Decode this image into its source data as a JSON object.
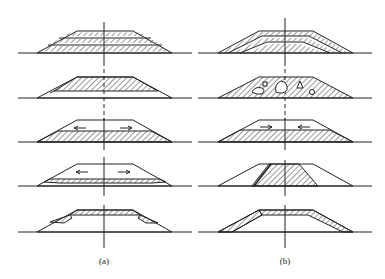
{
  "figure": {
    "colors": {
      "line": "#222222",
      "hatch": "#333333",
      "background": "#ffffff"
    },
    "columns": [
      {
        "label": "(a)",
        "center_x": 104,
        "rows": [
          {
            "id": "a1",
            "type": "horizontal-layers",
            "ground_y": 53
          },
          {
            "id": "a2",
            "type": "top-hatched-core",
            "ground_y": 98
          },
          {
            "id": "a3",
            "type": "bottom-fill-arrows-outward",
            "ground_y": 142
          },
          {
            "id": "a4",
            "type": "bottom-fill-arrows-outward-thin",
            "ground_y": 186
          },
          {
            "id": "a5",
            "type": "crest-and-berms-hatched",
            "ground_y": 232
          }
        ]
      },
      {
        "label": "(b)",
        "center_x": 285,
        "rows": [
          {
            "id": "b1",
            "type": "inclined-layers",
            "ground_y": 53
          },
          {
            "id": "b2",
            "type": "hatched-with-boulders",
            "ground_y": 98
          },
          {
            "id": "b3",
            "type": "bottom-fill-arrows-inward",
            "ground_y": 142
          },
          {
            "id": "b4",
            "type": "central-core-hatched",
            "ground_y": 186
          },
          {
            "id": "b5",
            "type": "crest-and-slope-hatched",
            "ground_y": 232
          }
        ]
      }
    ]
  },
  "labels": {
    "a": "(a)",
    "b": "(b)"
  }
}
